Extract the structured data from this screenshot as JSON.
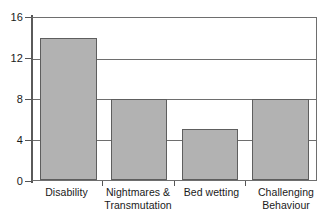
{
  "chart_data": {
    "type": "bar",
    "title": "",
    "subtitle": "",
    "xlabel": "",
    "ylabel": "",
    "categories": [
      "Disability",
      "Nightmares & Transmutation",
      "Bed wetting",
      "Challenging Behaviour"
    ],
    "category_lines": [
      [
        "Disability"
      ],
      [
        "Nightmares &",
        "Transmutation"
      ],
      [
        "Bed wetting"
      ],
      [
        "Challenging",
        "Behaviour"
      ]
    ],
    "values": [
      14,
      8,
      5,
      8
    ],
    "ylim": [
      0,
      16
    ],
    "ytick_values": [
      0,
      4,
      8,
      12,
      16
    ],
    "ytick_labels": [
      "0",
      "4",
      "8",
      "12",
      "16"
    ],
    "grid": true,
    "grid_axis": "y",
    "legend": null,
    "legend_position": "none",
    "colors": {
      "bar_fill": "#b2b2b2",
      "bar_edge": "#5e5e5e",
      "gridline": "#6e6e6e",
      "axis": "#555555",
      "text": "#1a1a1a",
      "background": "#ffffff"
    }
  }
}
